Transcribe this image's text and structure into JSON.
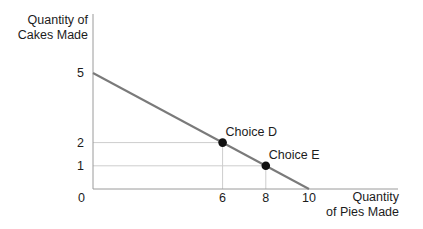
{
  "chart_data": {
    "type": "line",
    "xlabel_lines": [
      "Quantity",
      "of Pies Made"
    ],
    "ylabel_lines": [
      "Quantity of",
      "Cakes Made"
    ],
    "xlim": [
      0,
      10
    ],
    "ylim": [
      0,
      5
    ],
    "grid": "guide lines only from points to axes",
    "legend": "none",
    "segment": {
      "from": {
        "x": 0,
        "y": 5
      },
      "to": {
        "x": 10,
        "y": 0
      }
    },
    "x_intercept": 10,
    "y_intercept": 5,
    "origin_label": "0",
    "y_ticks": [
      {
        "value": 5,
        "label": "5"
      },
      {
        "value": 2,
        "label": "2"
      },
      {
        "value": 1,
        "label": "1"
      }
    ],
    "x_ticks": [
      {
        "value": 6,
        "label": "6"
      },
      {
        "value": 8,
        "label": "8"
      },
      {
        "value": 10,
        "label": "10"
      }
    ],
    "points": [
      {
        "label": "Choice D",
        "x": 6,
        "y": 2
      },
      {
        "label": "Choice E",
        "x": 8,
        "y": 1
      }
    ],
    "colors": {
      "background": "#ffffff",
      "axis": "#9a9a9a",
      "ppf_line": "#7a7a7a",
      "guide": "#cdcdcd",
      "point": "#111111",
      "text": "#1c1c1c"
    }
  }
}
